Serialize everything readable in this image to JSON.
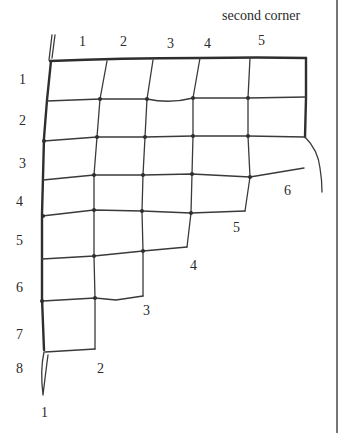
{
  "title": "second corner",
  "top_labels": [
    "1",
    "2",
    "3",
    "4",
    "5"
  ],
  "side_labels": [
    "1",
    "2",
    "3",
    "4",
    "5",
    "6",
    "7",
    "8"
  ],
  "diagonal_labels": [
    "6",
    "5",
    "4",
    "3",
    "2"
  ],
  "bottom_label": "1",
  "net": {
    "columns_per_row": [
      5,
      5,
      5,
      5,
      4,
      3,
      2,
      1
    ],
    "description": "Hand-drawn net diagram decreasing in a stair-step from the second corner"
  }
}
